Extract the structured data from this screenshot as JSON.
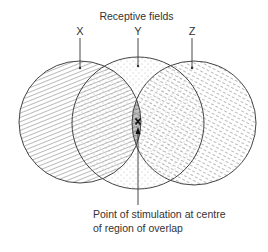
{
  "diagram": {
    "title": "Receptive fields",
    "fields": [
      {
        "label": "X",
        "cx": 80,
        "cy": 122,
        "r": 61,
        "fill": "hatch-diagonal-lines"
      },
      {
        "label": "Y",
        "cx": 138,
        "cy": 123,
        "r": 66,
        "fill": "stipple-dots"
      },
      {
        "label": "Z",
        "cx": 194,
        "cy": 123,
        "r": 62,
        "fill": "hatch-dashed-lines"
      }
    ],
    "stimulus_marker": "x",
    "caption_line1": "Point of stimulation at centre",
    "caption_line2": "of region of overlap",
    "colors": {
      "ink": "#333333",
      "background": "#ffffff"
    }
  }
}
